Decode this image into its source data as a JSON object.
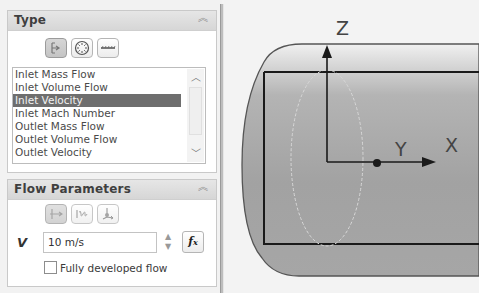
{
  "type_panel": {
    "title": "Type",
    "collapse_icon": "double-chevron-up",
    "type_buttons": [
      {
        "name": "flow-openings-icon",
        "active": true
      },
      {
        "name": "pressure-openings-icon",
        "active": false
      },
      {
        "name": "wall-icon",
        "active": false
      }
    ],
    "list_items": [
      {
        "label": "Inlet Mass Flow",
        "selected": false
      },
      {
        "label": "Inlet Volume Flow",
        "selected": false
      },
      {
        "label": "Inlet Velocity",
        "selected": true
      },
      {
        "label": "Inlet Mach Number",
        "selected": false
      },
      {
        "label": "Outlet Mass Flow",
        "selected": false
      },
      {
        "label": "Outlet Volume Flow",
        "selected": false
      },
      {
        "label": "Outlet Velocity",
        "selected": false
      }
    ],
    "scroll_up": "▲",
    "scroll_down": "▼"
  },
  "flow_panel": {
    "title": "Flow Parameters",
    "collapse_icon": "double-chevron-up",
    "direction_buttons": [
      {
        "name": "normal-to-face-icon",
        "active": true
      },
      {
        "name": "swirl-icon",
        "active": false
      },
      {
        "name": "3d-vector-icon",
        "active": false
      }
    ],
    "velocity_symbol": "V",
    "velocity_value": "10 m/s",
    "fx_label": "fx",
    "fully_developed_label": "Fully developed flow",
    "fully_developed_checked": false
  },
  "viewport": {
    "axis_z": "Z",
    "axis_y": "Y",
    "axis_x": "X"
  }
}
